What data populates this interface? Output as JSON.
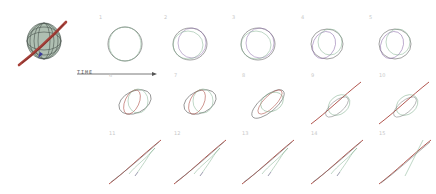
{
  "figure": {
    "time_label": "TIME",
    "colors": {
      "stroke_gray": "#7a7a7a",
      "stroke_green": "#7fae8c",
      "stroke_red": "#a8423a",
      "stroke_purple": "#8a6aa8",
      "stroke_blue": "#3a3a9a",
      "label_gray": "#c8c8c8",
      "arrow": "#555555"
    },
    "composite": {
      "description": "overlay of all stages"
    },
    "panels": [
      {
        "label": "1",
        "row": 0,
        "col": 0,
        "stage": "circle"
      },
      {
        "label": "2",
        "row": 0,
        "col": 1,
        "stage": "double-circle"
      },
      {
        "label": "3",
        "row": 0,
        "col": 2,
        "stage": "double-circle"
      },
      {
        "label": "4",
        "row": 0,
        "col": 3,
        "stage": "overlapping-ovals"
      },
      {
        "label": "5",
        "row": 0,
        "col": 4,
        "stage": "overlapping-ovals"
      },
      {
        "label": "6",
        "row": 1,
        "col": 0,
        "stage": "tilted-ovals"
      },
      {
        "label": "7",
        "row": 1,
        "col": 1,
        "stage": "tilted-ovals"
      },
      {
        "label": "8",
        "row": 1,
        "col": 2,
        "stage": "stretched-loops"
      },
      {
        "label": "9",
        "row": 1,
        "col": 3,
        "stage": "loop-with-line"
      },
      {
        "label": "10",
        "row": 1,
        "col": 4,
        "stage": "loop-with-line"
      },
      {
        "label": "11",
        "row": 2,
        "col": 0,
        "stage": "line-with-tail"
      },
      {
        "label": "12",
        "row": 2,
        "col": 1,
        "stage": "line-with-tail"
      },
      {
        "label": "13",
        "row": 2,
        "col": 2,
        "stage": "line-with-tail"
      },
      {
        "label": "14",
        "row": 2,
        "col": 3,
        "stage": "line-with-tail"
      },
      {
        "label": "15",
        "row": 2,
        "col": 4,
        "stage": "crossed-lines"
      }
    ]
  }
}
